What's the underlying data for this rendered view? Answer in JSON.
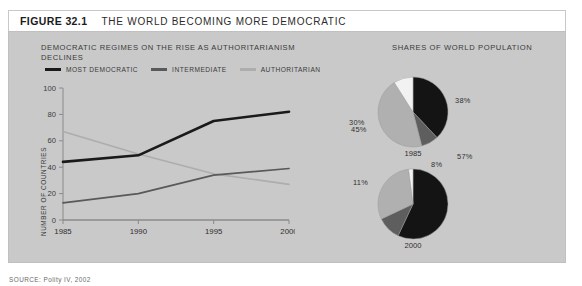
{
  "header": {
    "figure_label": "FIGURE 32.1",
    "title": "THE WORLD BECOMING MORE DEMOCRATIC"
  },
  "line_chart": {
    "title": "DEMOCRATIC REGIMES ON THE RISE AS AUTHORITARIANISM DECLINES",
    "ylabel": "NUMBER OF COUNTRIES",
    "legend": [
      {
        "label": "MOST DEMOCRATIC",
        "color": "#1a1a1a"
      },
      {
        "label": "INTERMEDIATE",
        "color": "#595959"
      },
      {
        "label": "AUTHORITARIAN",
        "color": "#adadad"
      }
    ],
    "yticks": [
      "0",
      "20",
      "40",
      "60",
      "80",
      "100"
    ],
    "xticks": [
      "1985",
      "1990",
      "1995",
      "2000"
    ]
  },
  "pie_section": {
    "title": "SHARES OF WORLD POPULATION",
    "pies": [
      {
        "year": "1985",
        "labels": [
          {
            "text": "38%",
            "x": 116,
            "y": 40
          },
          {
            "text": "8%",
            "x": 92,
            "y": 104
          },
          {
            "text": "45%",
            "x": 12,
            "y": 69
          }
        ]
      },
      {
        "year": "2000",
        "labels": [
          {
            "text": "57%",
            "x": 118,
            "y": 96
          },
          {
            "text": "11%",
            "x": 14,
            "y": 122
          },
          {
            "text": "30%",
            "x": 10,
            "y": 62
          }
        ]
      }
    ]
  },
  "source": "SOURCE: Polity IV, 2002",
  "chart_data": [
    {
      "type": "line",
      "title": "DEMOCRATIC REGIMES ON THE RISE AS AUTHORITARIANISM DECLINES",
      "xlabel": "",
      "ylabel": "NUMBER OF COUNTRIES",
      "x": [
        1985,
        1990,
        1995,
        2000
      ],
      "xlim": [
        1985,
        2000
      ],
      "ylim": [
        0,
        100
      ],
      "yticks": [
        0,
        20,
        40,
        60,
        80,
        100
      ],
      "grid": false,
      "legend_position": "top",
      "series": [
        {
          "name": "MOST DEMOCRATIC",
          "color": "#1a1a1a",
          "values": [
            44,
            49,
            75,
            82
          ]
        },
        {
          "name": "INTERMEDIATE",
          "color": "#595959",
          "values": [
            13,
            20,
            34,
            39
          ]
        },
        {
          "name": "AUTHORITARIAN",
          "color": "#adadad",
          "values": [
            67,
            50,
            35,
            27
          ]
        }
      ]
    },
    {
      "type": "pie",
      "title": "SHARES OF WORLD POPULATION",
      "subtitle": "1985",
      "labels": [
        "MOST DEMOCRATIC",
        "INTERMEDIATE",
        "AUTHORITARIAN",
        "UNLABELED"
      ],
      "values": [
        38,
        8,
        45,
        9
      ],
      "display_labels": [
        "38%",
        "8%",
        "45%",
        ""
      ],
      "colors": [
        "#141414",
        "#5e5e5e",
        "#b0b0b0",
        "#f2f2f2"
      ]
    },
    {
      "type": "pie",
      "title": "SHARES OF WORLD POPULATION",
      "subtitle": "2000",
      "labels": [
        "MOST DEMOCRATIC",
        "INTERMEDIATE",
        "AUTHORITARIAN",
        "UNLABELED"
      ],
      "values": [
        57,
        11,
        30,
        2
      ],
      "display_labels": [
        "57%",
        "11%",
        "30%",
        ""
      ],
      "colors": [
        "#141414",
        "#5e5e5e",
        "#b0b0b0",
        "#f2f2f2"
      ]
    }
  ]
}
